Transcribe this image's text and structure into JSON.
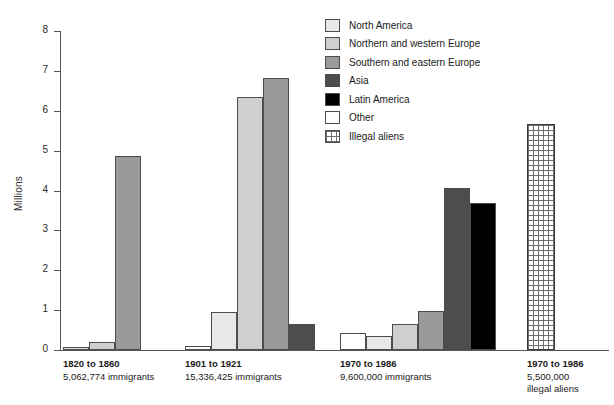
{
  "chart_data": {
    "type": "bar",
    "title": "",
    "xlabel": "",
    "ylabel": "Millions",
    "ylim": [
      0,
      8
    ],
    "yticks": [
      0,
      1,
      2,
      3,
      4,
      5,
      6,
      7,
      8
    ],
    "grid": false,
    "legend_position": "top-right",
    "legend": [
      {
        "name": "North America",
        "color": "#e8e8e8"
      },
      {
        "name": "Northern and western Europe",
        "color": "#cfcfcf"
      },
      {
        "name": "Southern and eastern Europe",
        "color": "#9a9a9a"
      },
      {
        "name": "Asia",
        "color": "#4d4d4d"
      },
      {
        "name": "Latin America",
        "color": "#000000"
      },
      {
        "name": "Other",
        "color": "#ffffff"
      },
      {
        "name": "Illegal aliens",
        "color": "hatch"
      }
    ],
    "categories": [
      "1820 to 1860",
      "1901 to 1921",
      "1970 to 1986",
      "1970 to 1986"
    ],
    "groups": [
      {
        "period": "1820 to 1860",
        "count": "5,062,774 immigrants",
        "count2": "",
        "bars": [
          {
            "series": "North America",
            "value": 0.08,
            "color": "#e8e8e8"
          },
          {
            "series": "Northern and western Europe",
            "value": 0.2,
            "color": "#cfcfcf"
          },
          {
            "series": "Southern and eastern Europe",
            "value": 4.87,
            "color": "#9a9a9a"
          }
        ]
      },
      {
        "period": "1901 to 1921",
        "count": "15,336,425 immigrants",
        "count2": "",
        "bars": [
          {
            "series": "North America",
            "value": 0.1,
            "color": "#ffffff"
          },
          {
            "series": "Northern and western Europe",
            "value": 0.95,
            "color": "#e8e8e8"
          },
          {
            "series": "Southern and eastern Europe",
            "value": 6.35,
            "color": "#cfcfcf"
          },
          {
            "series": "Asia",
            "value": 6.82,
            "color": "#9a9a9a"
          },
          {
            "series": "Latin America",
            "value": 0.65,
            "color": "#4d4d4d"
          }
        ]
      },
      {
        "period": "1970 to 1986",
        "count": "9,600,000 immigrants",
        "count2": "",
        "bars": [
          {
            "series": "North America",
            "value": 0.42,
            "color": "#ffffff"
          },
          {
            "series": "Northern and western Europe",
            "value": 0.36,
            "color": "#e8e8e8"
          },
          {
            "series": "Southern and eastern Europe",
            "value": 0.66,
            "color": "#cfcfcf"
          },
          {
            "series": "Asia",
            "value": 0.97,
            "color": "#9a9a9a"
          },
          {
            "series": "Latin America",
            "value": 4.07,
            "color": "#4d4d4d"
          },
          {
            "series": "Other",
            "value": 3.68,
            "color": "#000000"
          }
        ]
      },
      {
        "period": "1970 to 1986",
        "count": "5,500,000",
        "count2": "illegal aliens",
        "bars": [
          {
            "series": "Illegal aliens",
            "value": 5.67,
            "color": "hatch"
          }
        ]
      }
    ]
  },
  "axis": {
    "y_title": "Millions",
    "tick_labels": [
      "8",
      "7",
      "6",
      "5",
      "4",
      "3",
      "2",
      "1",
      "0"
    ]
  }
}
